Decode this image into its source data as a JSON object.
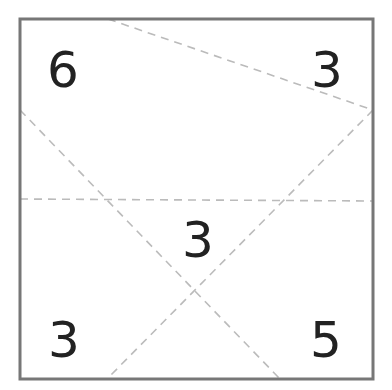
{
  "diagram": {
    "title": "",
    "frame": {
      "x": 20,
      "y": 19,
      "width": 353,
      "height": 360,
      "stroke": "#777777",
      "stroke_width": 3
    },
    "dashed_lines": [
      {
        "id": "line-top-to-right",
        "x1": 108,
        "y1": 19,
        "x2": 373,
        "y2": 110
      },
      {
        "id": "line-left-to-bottom",
        "x1": 20,
        "y1": 110,
        "x2": 280,
        "y2": 379
      },
      {
        "id": "line-right-to-bottom",
        "x1": 373,
        "y1": 110,
        "x2": 107,
        "y2": 379
      },
      {
        "id": "line-horizontal",
        "x1": 20,
        "y1": 199,
        "x2": 373,
        "y2": 201
      }
    ],
    "dash_color": "#bbbbbb",
    "labels": [
      {
        "id": "region-top-left",
        "text": "6",
        "x": 63,
        "y": 70
      },
      {
        "id": "region-top-right",
        "text": "3",
        "x": 327,
        "y": 70
      },
      {
        "id": "region-center",
        "text": "3",
        "x": 198,
        "y": 240
      },
      {
        "id": "region-bottom-left",
        "text": "3",
        "x": 64,
        "y": 340
      },
      {
        "id": "region-bottom-right",
        "text": "5",
        "x": 326,
        "y": 340
      }
    ]
  }
}
